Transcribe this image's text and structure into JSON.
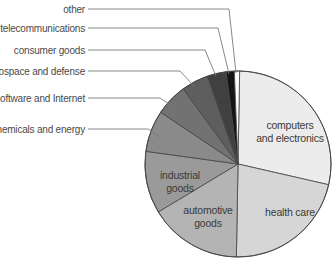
{
  "chart_data": {
    "type": "pie",
    "title": "",
    "start_angle_deg": 1,
    "direction": "clockwise",
    "center": [
      238,
      164
    ],
    "radius": 93,
    "slices": [
      {
        "label": "computers and electronics",
        "lines": [
          "computers",
          "and electronics"
        ],
        "value": 28.3,
        "color": "#ececec",
        "label_pos": "inside",
        "text_xy": [
          290,
          125
        ]
      },
      {
        "label": "health care",
        "lines": [
          "health care"
        ],
        "value": 21.7,
        "color": "#d6d6d6",
        "label_pos": "inside",
        "text_xy": [
          290,
          212
        ]
      },
      {
        "label": "automotive goods",
        "lines": [
          "automotive",
          "goods"
        ],
        "value": 16.1,
        "color": "#b4b4b4",
        "label_pos": "inside",
        "text_xy": [
          208,
          210
        ]
      },
      {
        "label": "industrial goods",
        "lines": [
          "industrial",
          "goods"
        ],
        "value": 10.8,
        "color": "#9a9a9a",
        "label_pos": "inside",
        "text_xy": [
          180,
          175
        ]
      },
      {
        "label": "chemicals and energy",
        "lines": [
          "chemicals and energy"
        ],
        "value": 7.2,
        "color": "#8a8a8a",
        "label_pos": "outside",
        "text_xy": [
          85,
          129
        ],
        "leader": [
          [
            88,
            129
          ],
          [
            148,
            129
          ],
          [
            160,
            137
          ]
        ]
      },
      {
        "label": "software and Internet",
        "lines": [
          "software and Internet"
        ],
        "value": 5.6,
        "color": "#727272",
        "label_pos": "outside",
        "text_xy": [
          85,
          98
        ],
        "leader": [
          [
            88,
            98
          ],
          [
            160,
            98
          ],
          [
            172,
            106
          ]
        ]
      },
      {
        "label": "aerospace and defense",
        "lines": [
          "aerospace and defense"
        ],
        "value": 4.7,
        "color": "#5e5e5e",
        "label_pos": "outside",
        "text_xy": [
          85,
          71
        ],
        "leader": [
          [
            88,
            71
          ],
          [
            180,
            71
          ],
          [
            194,
            86
          ]
        ]
      },
      {
        "label": "consumer goods",
        "lines": [
          "consumer goods"
        ],
        "value": 3.3,
        "color": "#404040",
        "label_pos": "outside",
        "text_xy": [
          85,
          50
        ],
        "leader": [
          [
            88,
            50
          ],
          [
            205,
            50
          ],
          [
            216,
            76
          ]
        ]
      },
      {
        "label": "telecommunications",
        "lines": [
          "telecommunications"
        ],
        "value": 1.4,
        "color": "#141414",
        "label_pos": "outside",
        "text_xy": [
          85,
          28
        ],
        "leader": [
          [
            88,
            28
          ],
          [
            218,
            28
          ],
          [
            229,
            74
          ]
        ]
      },
      {
        "label": "other",
        "lines": [
          "other"
        ],
        "value": 0.9,
        "color": "#ffffff",
        "label_pos": "outside",
        "text_xy": [
          85,
          9
        ],
        "leader": [
          [
            88,
            9
          ],
          [
            229,
            9
          ],
          [
            236,
            73
          ]
        ]
      }
    ],
    "legend": "none (direct labels with leader lines)"
  }
}
